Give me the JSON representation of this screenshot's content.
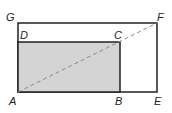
{
  "diagram": {
    "type": "geometry",
    "points": {
      "A": {
        "label": "A",
        "x": 18,
        "y": 92
      },
      "B": {
        "label": "B",
        "x": 120,
        "y": 92
      },
      "C": {
        "label": "C",
        "x": 120,
        "y": 42
      },
      "D": {
        "label": "D",
        "x": 18,
        "y": 42
      },
      "E": {
        "label": "E",
        "x": 157,
        "y": 92
      },
      "F": {
        "label": "F",
        "x": 157,
        "y": 23
      },
      "G": {
        "label": "G",
        "x": 18,
        "y": 23
      }
    },
    "labels": {
      "A": "A",
      "B": "B",
      "C": "C",
      "D": "D",
      "E": "E",
      "F": "F",
      "G": "G"
    },
    "colors": {
      "shade": "#d4d4d4",
      "stroke": "#222222",
      "dash": "#888888"
    }
  }
}
